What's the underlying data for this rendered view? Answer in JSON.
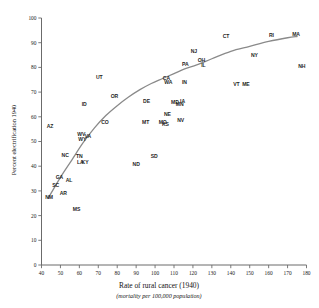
{
  "chart_data": {
    "type": "scatter",
    "title": "",
    "xlabel": "Rate of rural cancer (1940)",
    "xsublabel": "(mortality per 100,000 population)",
    "ylabel": "Percent electrification 1940",
    "xlim": [
      40,
      180
    ],
    "ylim": [
      0,
      100
    ],
    "xticks": [
      "40",
      "50",
      "60",
      "70",
      "80",
      "90",
      "100",
      "110",
      "120",
      "130",
      "140",
      "150",
      "160",
      "170",
      "180"
    ],
    "yticks": [
      "0",
      "10",
      "20",
      "30",
      "40",
      "50",
      "60",
      "70",
      "80",
      "90",
      "100"
    ],
    "grid": false,
    "legend": "none",
    "point_marker": "text-label",
    "series_name": "US states",
    "points": [
      {
        "label": "AZ",
        "x": 44.5,
        "y": 56.0
      },
      {
        "label": "NM",
        "x": 44.0,
        "y": 27.5
      },
      {
        "label": "SC",
        "x": 47.5,
        "y": 32.5
      },
      {
        "label": "GA",
        "x": 49.5,
        "y": 35.5
      },
      {
        "label": "AR",
        "x": 51.5,
        "y": 29.0
      },
      {
        "label": "NC",
        "x": 52.5,
        "y": 44.5
      },
      {
        "label": "AL",
        "x": 54.5,
        "y": 34.5
      },
      {
        "label": "MS",
        "x": 58.5,
        "y": 22.5
      },
      {
        "label": "TN",
        "x": 60.0,
        "y": 44.0
      },
      {
        "label": "LA",
        "x": 60.5,
        "y": 41.5
      },
      {
        "label": "KY",
        "x": 63.0,
        "y": 41.5
      },
      {
        "label": "WV",
        "x": 61.0,
        "y": 53.0
      },
      {
        "label": "WY",
        "x": 61.5,
        "y": 51.0
      },
      {
        "label": "VA",
        "x": 64.5,
        "y": 52.0
      },
      {
        "label": "ID",
        "x": 62.5,
        "y": 65.0
      },
      {
        "label": "UT",
        "x": 70.5,
        "y": 76.0
      },
      {
        "label": "CO",
        "x": 73.5,
        "y": 58.0
      },
      {
        "label": "OR",
        "x": 78.5,
        "y": 68.5
      },
      {
        "label": "ND",
        "x": 90.0,
        "y": 41.0
      },
      {
        "label": "MT",
        "x": 95.0,
        "y": 58.0
      },
      {
        "label": "DE",
        "x": 95.5,
        "y": 66.5
      },
      {
        "label": "SD",
        "x": 99.5,
        "y": 44.0
      },
      {
        "label": "MO",
        "x": 104.0,
        "y": 58.0
      },
      {
        "label": "KS",
        "x": 105.5,
        "y": 57.0
      },
      {
        "label": "NE",
        "x": 106.5,
        "y": 61.0
      },
      {
        "label": "CA",
        "x": 106.0,
        "y": 75.5
      },
      {
        "label": "WA",
        "x": 107.0,
        "y": 74.0
      },
      {
        "label": "MD",
        "x": 110.5,
        "y": 66.0
      },
      {
        "label": "MN",
        "x": 113.0,
        "y": 65.0
      },
      {
        "label": "IA",
        "x": 114.5,
        "y": 66.5
      },
      {
        "label": "NV",
        "x": 113.5,
        "y": 58.5
      },
      {
        "label": "IN",
        "x": 115.5,
        "y": 74.0
      },
      {
        "label": "PA",
        "x": 116.0,
        "y": 81.5
      },
      {
        "label": "NJ",
        "x": 120.5,
        "y": 86.5
      },
      {
        "label": "OH",
        "x": 124.5,
        "y": 83.0
      },
      {
        "label": "IL",
        "x": 125.5,
        "y": 81.0
      },
      {
        "label": "CT",
        "x": 137.5,
        "y": 92.5
      },
      {
        "label": "VT",
        "x": 143.0,
        "y": 73.0
      },
      {
        "label": "ME",
        "x": 148.0,
        "y": 73.0
      },
      {
        "label": "NY",
        "x": 152.5,
        "y": 85.0
      },
      {
        "label": "RI",
        "x": 161.5,
        "y": 93.0
      },
      {
        "label": "MA",
        "x": 174.5,
        "y": 93.5
      },
      {
        "label": "NH",
        "x": 177.5,
        "y": 80.5
      }
    ],
    "trend_curve": {
      "description": "fitted concave increasing curve",
      "points": [
        {
          "x": 43.5,
          "y": 27.0
        },
        {
          "x": 50.0,
          "y": 35.5
        },
        {
          "x": 56.0,
          "y": 42.5
        },
        {
          "x": 62.0,
          "y": 49.5
        },
        {
          "x": 68.0,
          "y": 55.5
        },
        {
          "x": 74.0,
          "y": 60.5
        },
        {
          "x": 80.0,
          "y": 64.5
        },
        {
          "x": 86.0,
          "y": 68.0
        },
        {
          "x": 92.0,
          "y": 71.0
        },
        {
          "x": 98.0,
          "y": 73.5
        },
        {
          "x": 104.0,
          "y": 75.5
        },
        {
          "x": 110.0,
          "y": 77.5
        },
        {
          "x": 116.0,
          "y": 79.5
        },
        {
          "x": 122.0,
          "y": 81.0
        },
        {
          "x": 130.0,
          "y": 83.5
        },
        {
          "x": 140.0,
          "y": 86.5
        },
        {
          "x": 150.0,
          "y": 88.5
        },
        {
          "x": 160.0,
          "y": 90.5
        },
        {
          "x": 170.0,
          "y": 92.0
        },
        {
          "x": 175.0,
          "y": 92.5
        }
      ]
    }
  }
}
